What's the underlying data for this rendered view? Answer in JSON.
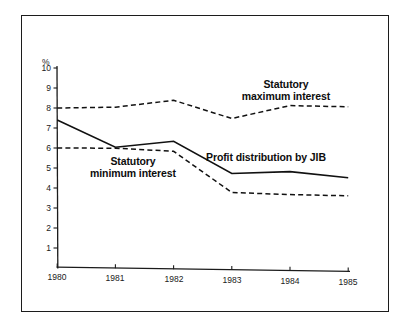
{
  "chart_data": {
    "type": "line",
    "title": "",
    "subtitle": "",
    "xlabel": "",
    "ylabel": "%",
    "y_unit_symbol": "%",
    "categories": [
      "1980",
      "1981",
      "1982",
      "1983",
      "1984",
      "1985"
    ],
    "x": [
      1980,
      1981,
      1982,
      1983,
      1984,
      1985
    ],
    "xlim": [
      1980,
      1985
    ],
    "ylim": [
      0,
      10
    ],
    "y_ticks": [
      "1",
      "2",
      "3",
      "4",
      "5",
      "6",
      "7",
      "8",
      "9",
      "10"
    ],
    "y_tick_values": [
      1,
      2,
      3,
      4,
      5,
      6,
      7,
      8,
      9,
      10
    ],
    "x_ticks": [
      "1980",
      "1981",
      "1982",
      "1983",
      "1984",
      "1985"
    ],
    "grid": false,
    "legend_position": "inline-annotations",
    "series": [
      {
        "name": "Statutory maximum interest",
        "style": "dashed",
        "color": "#111111",
        "values": [
          8.0,
          8.05,
          8.4,
          7.5,
          8.15,
          8.1
        ]
      },
      {
        "name": "Profit distribution by JIB",
        "style": "solid",
        "color": "#111111",
        "values": [
          7.4,
          6.05,
          6.35,
          4.75,
          4.85,
          4.55
        ]
      },
      {
        "name": "Statutory minimum interest",
        "style": "dashed",
        "color": "#111111",
        "values": [
          6.0,
          6.0,
          5.85,
          3.8,
          3.7,
          3.65
        ]
      }
    ],
    "annotations": [
      {
        "id": "max",
        "text_line1": "Statutory",
        "text_line2": "maximum interest"
      },
      {
        "id": "min",
        "text_line1": "Statutory",
        "text_line2": "minimum interest"
      },
      {
        "id": "profit",
        "text_line1": "Profit distribution by JIB",
        "text_line2": ""
      }
    ]
  },
  "labels": {
    "y_axis_unit": "%",
    "y10": "10",
    "y9": "9",
    "y8": "8",
    "y7": "7",
    "y6": "6",
    "y5": "5",
    "y4": "4",
    "y3": "3",
    "y2": "2",
    "y1": "1",
    "x1980": "1980",
    "x1981": "1981",
    "x1982": "1982",
    "x1983": "1983",
    "x1984": "1984",
    "x1985": "1985",
    "annot_max_l1": "Statutory",
    "annot_max_l2": "maximum interest",
    "annot_min_l1": "Statutory",
    "annot_min_l2": "minimum interest",
    "annot_profit": "Profit distribution by JIB"
  },
  "colors": {
    "ink": "#111111",
    "frame": "#1c1c1c",
    "background": "#ffffff"
  }
}
